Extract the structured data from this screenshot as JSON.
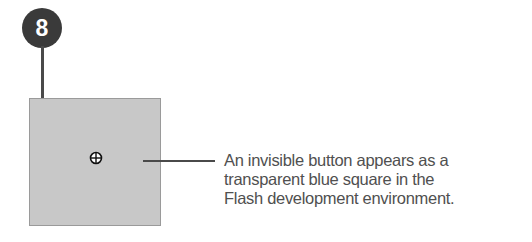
{
  "step_badge": {
    "number": "8",
    "color": "#3a3a3a"
  },
  "invisible_button_square": {
    "fill_color": "#c8c8c8",
    "icon": "crosshair-registration-point-icon"
  },
  "callout": {
    "lines": [
      "An invisible button appears as a",
      "transparent blue square in the",
      "Flash development environment."
    ]
  }
}
